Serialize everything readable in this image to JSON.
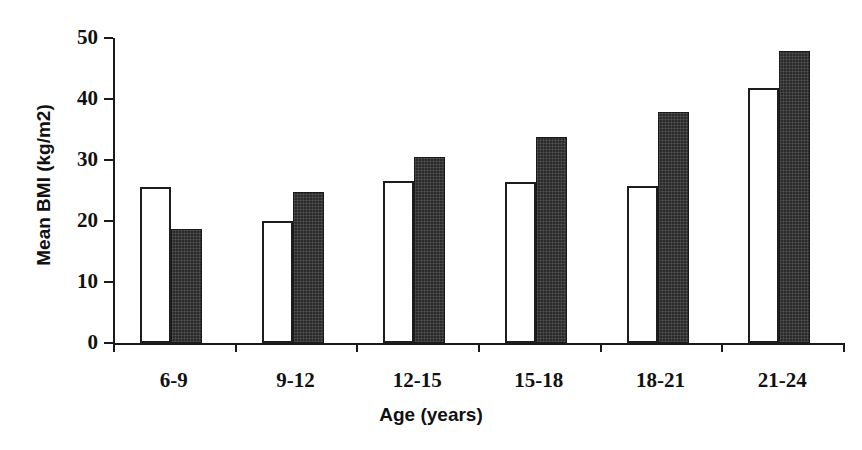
{
  "chart_data": {
    "type": "bar",
    "title": "",
    "xlabel": "Age (years)",
    "ylabel": "Mean BMI (kg/m2)",
    "categories": [
      "6-9",
      "9-12",
      "12-15",
      "15-18",
      "18-21",
      "21-24"
    ],
    "series": [
      {
        "name": "open-bars",
        "style": "white-fill-black-outline",
        "values": [
          25.5,
          20.0,
          26.6,
          26.4,
          25.8,
          41.8
        ]
      },
      {
        "name": "filled-bars",
        "style": "dark-fill",
        "values": [
          18.7,
          24.8,
          30.5,
          33.7,
          37.9,
          47.8
        ]
      }
    ],
    "ylim": [
      0,
      50
    ],
    "yticks": [
      0,
      10,
      20,
      30,
      40,
      50
    ],
    "ytick_labels": [
      "0",
      "10",
      "20",
      "30",
      "40",
      "50"
    ],
    "grid": false,
    "legend": "none",
    "colors": {
      "axis": "#1a1a1a",
      "open_bar_fill": "#ffffff",
      "open_bar_stroke": "#1d1d1d",
      "filled_bar": "#2b2b2b",
      "text": "#111111",
      "background": "#ffffff"
    }
  }
}
